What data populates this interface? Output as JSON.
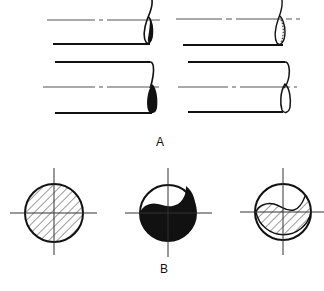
{
  "figure": {
    "panel_a": {
      "label": "A",
      "description": "Four cylindrical bar ends shown in elevation with broken-end conventions",
      "items": [
        {
          "name": "solid-bar-break-top-left",
          "fill": "solid-black-partial"
        },
        {
          "name": "tube-break-top-right",
          "fill": "hatched-ring"
        },
        {
          "name": "solid-bar-break-bottom-left",
          "fill": "solid-black"
        },
        {
          "name": "bar-break-bottom-right",
          "fill": "none"
        }
      ]
    },
    "panel_b": {
      "label": "B",
      "description": "Three circular cross-sections with center crosshairs",
      "items": [
        {
          "name": "hatched-full-section",
          "fill": "hatched"
        },
        {
          "name": "yin-yang-solid-section",
          "fill": "solid-black"
        },
        {
          "name": "yin-yang-hatched-section",
          "fill": "hatched"
        }
      ]
    },
    "colors": {
      "line": "#111111",
      "background": "#ffffff",
      "centerline": "#555555"
    }
  }
}
